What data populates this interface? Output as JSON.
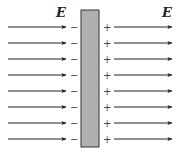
{
  "diagram": {
    "field_label_left": "E",
    "field_label_right": "E",
    "arrow_count": 8,
    "arrow_rows_y": [
      27,
      43,
      59,
      75,
      91,
      107,
      123,
      139
    ],
    "left_surface_charge": "−",
    "right_surface_charge": "+",
    "colors": {
      "slab_fill": "#b0b0b0",
      "slab_stroke": "#333333",
      "arrow": "#222222",
      "background": "#ffffff"
    }
  }
}
